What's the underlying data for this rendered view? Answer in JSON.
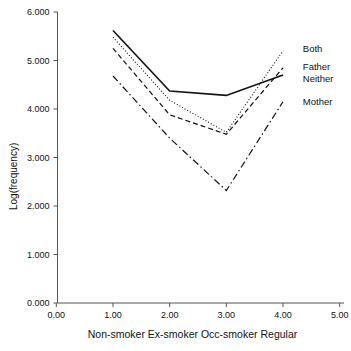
{
  "chart_data": {
    "type": "line",
    "title": "",
    "subtitle": "",
    "xlabel": "Non-smoker Ex-smoker Occ-smoker Regular",
    "ylabel": "Log(frequency)",
    "xlim": [
      0.0,
      5.0
    ],
    "ylim": [
      0.0,
      6.0
    ],
    "grid": false,
    "legend_position": "right-inline",
    "x": [
      1.0,
      2.0,
      3.0,
      4.0
    ],
    "x_tick_labels": [
      "0.00",
      "1.00",
      "2.00",
      "3.00",
      "4.00",
      "5.00"
    ],
    "x_tick_values": [
      0.0,
      1.0,
      2.0,
      3.0,
      4.0,
      5.0
    ],
    "y_tick_labels": [
      "0.000",
      "1.000",
      "2.000",
      "3.000",
      "4.000",
      "5.000",
      "6.000"
    ],
    "y_tick_values": [
      0.0,
      1.0,
      2.0,
      3.0,
      4.0,
      5.0,
      6.0
    ],
    "category_labels": [
      "Non-smoker",
      "Ex-smoker",
      "Occ-smoker",
      "Regular"
    ],
    "series": [
      {
        "name": "Neither",
        "style": "solid",
        "values": [
          5.62,
          4.37,
          4.28,
          4.7
        ]
      },
      {
        "name": "Both",
        "style": "dotted",
        "values": [
          5.48,
          4.18,
          3.52,
          5.2
        ]
      },
      {
        "name": "Father",
        "style": "dashed",
        "values": [
          5.25,
          3.88,
          3.48,
          4.85
        ]
      },
      {
        "name": "Mother",
        "style": "dash-dot",
        "values": [
          4.68,
          3.4,
          2.32,
          4.15
        ]
      }
    ],
    "annotations": [
      {
        "text": "Both",
        "x": 4.35,
        "y": 5.25
      },
      {
        "text": "Father",
        "x": 4.35,
        "y": 4.88
      },
      {
        "text": "Neither",
        "x": 4.35,
        "y": 4.62
      },
      {
        "text": "Mother",
        "x": 4.35,
        "y": 4.15
      }
    ]
  },
  "axes": {
    "y_title": "Log(frequency)",
    "x_title": "Non-smoker Ex-smoker Occ-smoker Regular"
  },
  "legend": {
    "items": [
      {
        "label": "Both"
      },
      {
        "label": "Father"
      },
      {
        "label": "Neither"
      },
      {
        "label": "Mother"
      }
    ]
  },
  "colors": {
    "line": "#111111",
    "axis": "#555555",
    "text": "#111111",
    "background": "#ffffff"
  }
}
